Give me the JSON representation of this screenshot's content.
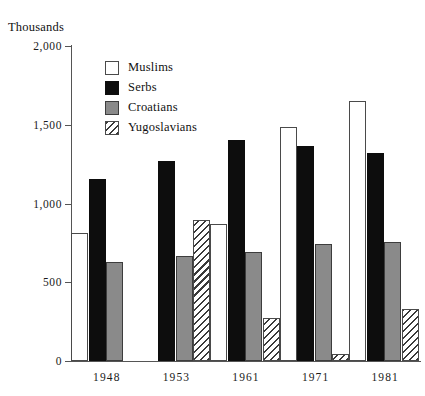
{
  "chart_data": {
    "type": "bar",
    "title": "",
    "unit_caption": "Thousands",
    "xlabel": "",
    "ylabel": "",
    "categories": [
      "1948",
      "1953",
      "1961",
      "1971",
      "1981"
    ],
    "ylim": [
      0,
      2000
    ],
    "yticks": [
      0,
      500,
      1000,
      1500,
      2000
    ],
    "ytick_labels": [
      "0",
      "500",
      "1,000",
      "1,500",
      "2,000"
    ],
    "grid": false,
    "legend_position": "upper-center-left",
    "series": [
      {
        "name": "Muslims",
        "color": "#ffffff",
        "fill": "solid-white-outline",
        "values": [
          810,
          null,
          873,
          1487,
          1652
        ]
      },
      {
        "name": "Serbs",
        "color": "#0d0d0d",
        "fill": "solid-black",
        "values": [
          1158,
          1272,
          1405,
          1367,
          1320
        ]
      },
      {
        "name": "Croatians",
        "color": "#8a8a8a",
        "fill": "solid-gray",
        "values": [
          627,
          665,
          690,
          741,
          757
        ]
      },
      {
        "name": "Yugoslavians",
        "color": "#3a3a3a",
        "fill": "diagonal-hatch",
        "values": [
          null,
          893,
          276,
          43,
          328
        ]
      }
    ]
  },
  "legend": {
    "items": [
      {
        "label": "Muslims",
        "key": "muslims"
      },
      {
        "label": "Serbs",
        "key": "serbs"
      },
      {
        "label": "Croatians",
        "key": "croatians"
      },
      {
        "label": "Yugoslavians",
        "key": "yugoslavians"
      }
    ]
  }
}
